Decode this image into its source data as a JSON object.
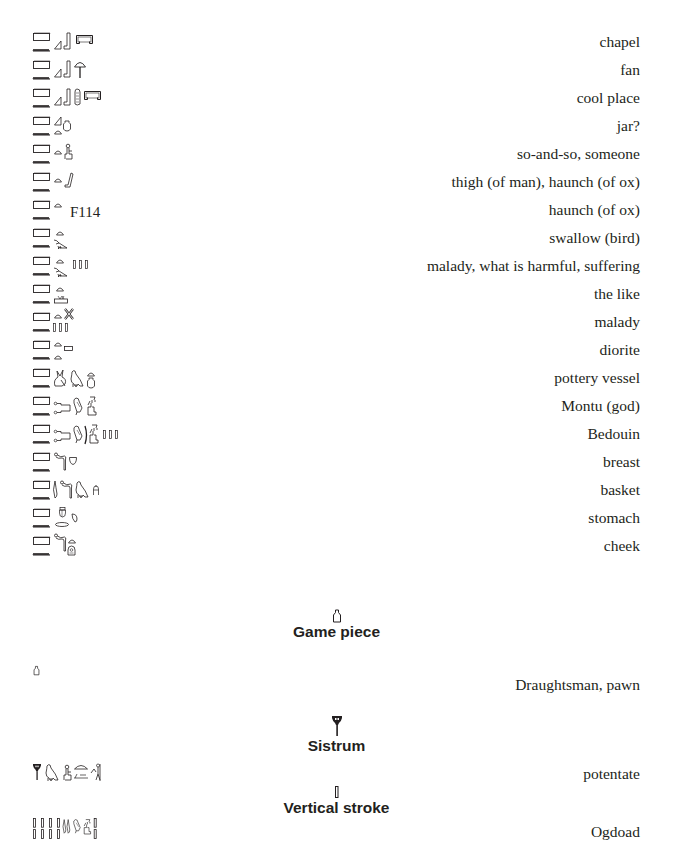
{
  "entries": [
    {
      "gloss": "chapel",
      "glyph_names": [
        "pool-sign",
        "water-ripple",
        "slope-sign",
        "leg-sign",
        "shrine-enclosure"
      ]
    },
    {
      "gloss": "fan",
      "glyph_names": [
        "pool-sign",
        "water-ripple",
        "slope-sign",
        "leg-sign",
        "fan-sign"
      ]
    },
    {
      "gloss": "cool place",
      "glyph_names": [
        "pool-sign",
        "water-ripple",
        "slope-sign",
        "leg-sign",
        "cord-sign",
        "shrine-enclosure"
      ]
    },
    {
      "gloss": "jar?",
      "glyph_names": [
        "pool-sign",
        "water-ripple",
        "slope-sign",
        "bread-loaf",
        "jar-sign"
      ]
    },
    {
      "gloss": "so-and-so, someone",
      "glyph_names": [
        "pool-sign",
        "water-ripple",
        "bread-loaf",
        "seated-man"
      ]
    },
    {
      "gloss": "thigh (of man), haunch (of ox)",
      "glyph_names": [
        "pool-sign",
        "water-ripple",
        "bread-loaf",
        "thigh-sign"
      ]
    },
    {
      "gloss": "haunch (of ox)",
      "glyph_names": [
        "pool-sign",
        "water-ripple",
        "bread-loaf"
      ],
      "code": "F114"
    },
    {
      "gloss": "swallow (bird)",
      "glyph_names": [
        "pool-sign",
        "water-ripple",
        "bread-loaf",
        "swallow-bird"
      ]
    },
    {
      "gloss": "malady, what is harmful, suffering",
      "glyph_names": [
        "pool-sign",
        "water-ripple",
        "bread-loaf",
        "swallow-bird",
        "plural-strokes"
      ]
    },
    {
      "gloss": "the like",
      "glyph_names": [
        "pool-sign",
        "water-ripple",
        "bread-loaf",
        "land-sign"
      ]
    },
    {
      "gloss": "malady",
      "glyph_names": [
        "pool-sign",
        "water-ripple",
        "bread-loaf",
        "cross-sign",
        "plural-strokes"
      ]
    },
    {
      "gloss": "diorite",
      "glyph_names": [
        "pool-sign",
        "water-ripple",
        "bread-loaf",
        "stone-block",
        "bread-loaf"
      ]
    },
    {
      "gloss": "pottery vessel",
      "glyph_names": [
        "pool-sign",
        "water-ripple",
        "hare-sign",
        "vulture-bird",
        "bread-loaf",
        "jar-sign"
      ]
    },
    {
      "gloss": "Montu (god)",
      "glyph_names": [
        "pool-sign",
        "water-ripple",
        "mooring-post",
        "quail-chick",
        "seated-god"
      ]
    },
    {
      "gloss": "Bedouin",
      "glyph_names": [
        "pool-sign",
        "water-ripple",
        "mooring-post",
        "quail-chick",
        "throw-stick",
        "seated-man",
        "plural-strokes"
      ]
    },
    {
      "gloss": "breast",
      "glyph_names": [
        "pool-sign",
        "water-ripple",
        "cobra-sign",
        "breast-sign"
      ]
    },
    {
      "gloss": "basket",
      "glyph_names": [
        "pool-sign",
        "water-ripple",
        "reed-sign",
        "cobra-sign",
        "vulture-bird",
        "basket-sign"
      ]
    },
    {
      "gloss": "stomach",
      "glyph_names": [
        "pool-sign",
        "water-ripple",
        "heart-sign",
        "oval-sign",
        "drop-sign"
      ]
    },
    {
      "gloss": "cheek",
      "glyph_names": [
        "pool-sign",
        "water-ripple",
        "cobra-sign",
        "bread-loaf",
        "cheek-sign"
      ]
    }
  ],
  "sections": [
    {
      "title": "Game piece",
      "icon": "game-piece-icon",
      "entries": [
        {
          "gloss": "Draughtsman, pawn",
          "glyph_names": [
            "game-piece"
          ]
        }
      ]
    },
    {
      "title": "Sistrum",
      "icon": "sistrum-icon",
      "entries": [
        {
          "gloss": "potentate",
          "glyph_names": [
            "sistrum",
            "vulture-bird",
            "seated-man",
            "horizon-sign",
            "man-with-staff"
          ]
        }
      ]
    },
    {
      "title": "Vertical stroke",
      "icon": "vertical-stroke-icon",
      "entries": [
        {
          "gloss": "Ogdoad",
          "glyph_names": [
            "vertical-stroke",
            "vertical-stroke",
            "vertical-stroke",
            "vertical-stroke",
            "reed-sign",
            "quail-chick",
            "seated-god",
            "plural-strokes"
          ]
        }
      ]
    }
  ],
  "colors": {
    "text": "#231f20",
    "background": "#ffffff"
  }
}
